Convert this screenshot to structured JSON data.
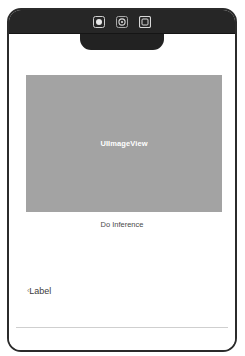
{
  "app": {
    "title": "iOS Simulator Interface Builder Preview"
  },
  "toolbar": {
    "icons": [
      {
        "name": "record-icon",
        "label": "Record"
      },
      {
        "name": "settings-gear-icon",
        "label": "Settings"
      },
      {
        "name": "screenshot-icon",
        "label": "Screenshot"
      }
    ],
    "background_color": "#262626"
  },
  "device": {
    "frame_color": "#2b2b2b",
    "notch_color": "#222222",
    "screen_background": "#ffffff"
  },
  "main": {
    "image_view": {
      "label": "UIImageView",
      "background_color": "#a3a3a3",
      "text_color": "#ffffff"
    },
    "inference_button": {
      "label": "Do Inference",
      "text_color": "#4a4a4a"
    },
    "result_label": {
      "caret": "‹",
      "text": "Label",
      "text_color": "#3d3d3d"
    }
  },
  "constraints": {
    "handle_fill": "#ffffff",
    "handle_border": "#bdbdbd",
    "rows": [
      {
        "name": "constraint-row-upper",
        "top": 232,
        "handles": [
          {
            "name": "constraint-handle-upper-left",
            "left": 24
          },
          {
            "name": "constraint-handle-upper-center",
            "left": 119
          },
          {
            "name": "constraint-handle-upper-right",
            "left": 215
          }
        ]
      },
      {
        "name": "constraint-row-middle",
        "top": 283,
        "handles": [
          {
            "name": "constraint-handle-middle-right",
            "left": 215
          }
        ]
      },
      {
        "name": "constraint-row-lower",
        "top": 339,
        "handles": [
          {
            "name": "constraint-handle-lower-left",
            "left": 24
          },
          {
            "name": "constraint-handle-lower-center",
            "left": 119
          },
          {
            "name": "constraint-handle-lower-right",
            "left": 215
          }
        ]
      }
    ]
  }
}
